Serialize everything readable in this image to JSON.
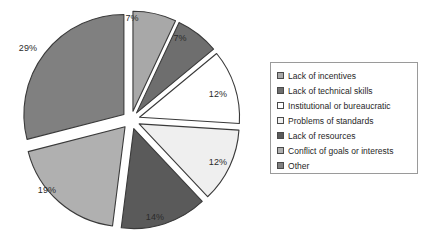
{
  "chart_data": {
    "type": "pie",
    "title": "",
    "subtitle": "",
    "xlabel": "",
    "ylabel": "",
    "legend_position": "right",
    "grid": false,
    "exploded": true,
    "categories": [
      "Lack of incentives",
      "Lack of technical skills",
      "Institutional or bureaucratic",
      "Problems of standards",
      "Lack of resources",
      "Conflict of goals or interests",
      "Other"
    ],
    "values": [
      7,
      7,
      12,
      12,
      14,
      19,
      29
    ],
    "data_labels": [
      "7%",
      "7%",
      "12%",
      "12%",
      "14%",
      "19%",
      "29%"
    ],
    "colors": [
      "#a8a8a8",
      "#6e6e6e",
      "#ffffff",
      "#efefef",
      "#5a5a5a",
      "#b0b0b0",
      "#808080"
    ],
    "slices": [
      {
        "label": "Lack of incentives",
        "value": 7,
        "data_label": "7%",
        "color": "#a8a8a8",
        "start_angle": 0,
        "end_angle": 25.2,
        "label_x": 132,
        "label_y": 18
      },
      {
        "label": "Lack of technical skills",
        "value": 7,
        "data_label": "7%",
        "color": "#6e6e6e",
        "start_angle": 25.2,
        "end_angle": 50.4,
        "label_x": 180,
        "label_y": 38
      },
      {
        "label": "Institutional or bureaucratic",
        "value": 12,
        "data_label": "12%",
        "color": "#ffffff",
        "start_angle": 50.4,
        "end_angle": 93.6,
        "label_x": 218,
        "label_y": 94
      },
      {
        "label": "Problems of standards",
        "value": 12,
        "data_label": "12%",
        "color": "#efefef",
        "start_angle": 93.6,
        "end_angle": 136.8,
        "label_x": 218,
        "label_y": 162
      },
      {
        "label": "Lack of resources",
        "value": 14,
        "data_label": "14%",
        "color": "#5a5a5a",
        "start_angle": 136.8,
        "end_angle": 187.2,
        "label_x": 155,
        "label_y": 217
      },
      {
        "label": "Conflict of goals or interests",
        "value": 19,
        "data_label": "19%",
        "color": "#b0b0b0",
        "start_angle": 187.2,
        "end_angle": 255.6,
        "label_x": 47,
        "label_y": 190
      },
      {
        "label": "Other",
        "value": 29,
        "data_label": "29%",
        "color": "#808080",
        "start_angle": 255.6,
        "end_angle": 360,
        "label_x": 28,
        "label_y": 48
      }
    ]
  },
  "legend": {
    "items": [
      {
        "label": "Lack of incentives",
        "color": "#a8a8a8"
      },
      {
        "label": "Lack of technical skills",
        "color": "#6e6e6e"
      },
      {
        "label": "Institutional or bureaucratic",
        "color": "#ffffff"
      },
      {
        "label": "Problems of standards",
        "color": "#efefef"
      },
      {
        "label": "Lack of resources",
        "color": "#5a5a5a"
      },
      {
        "label": "Conflict of goals or interests",
        "color": "#b0b0b0"
      },
      {
        "label": "Other",
        "color": "#808080"
      }
    ]
  }
}
